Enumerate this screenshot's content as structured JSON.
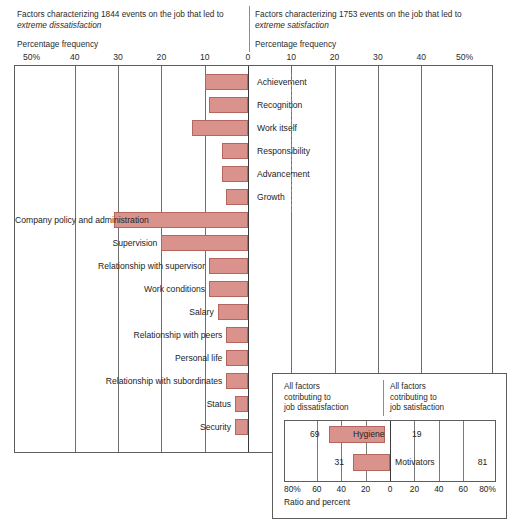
{
  "header": {
    "left": {
      "line1": "Factors characterizing 1844 events on the job that led to",
      "emphasis": "extreme dissatisfaction",
      "frequency_label": "Percentage frequency"
    },
    "right": {
      "line1": "Factors characterizing 1753 events on the job that led to",
      "emphasis": "extreme satisfaction",
      "frequency_label": "Percentage frequency"
    }
  },
  "axis": {
    "ticks": [
      "50%",
      "40",
      "30",
      "20",
      "10",
      "0",
      "10",
      "20",
      "30",
      "40",
      "50%"
    ],
    "tick_values": [
      -50,
      -40,
      -30,
      -20,
      -10,
      0,
      10,
      20,
      30,
      40,
      50
    ]
  },
  "inset": {
    "caption_left": "All factors cotributing to job dissatisfaction",
    "caption_left_lines": [
      "All factors",
      "cotributing to",
      "job dissatisfaction"
    ],
    "caption_right_lines": [
      "All factors",
      "cotributing to",
      "job satisfaction"
    ],
    "axis_title": "Ratio and percent",
    "ticks": [
      "80%",
      "60",
      "40",
      "20",
      "0",
      "20",
      "40",
      "60",
      "80%"
    ],
    "tick_values": [
      -80,
      -60,
      -40,
      -20,
      0,
      20,
      40,
      60,
      80
    ],
    "rows": [
      {
        "name": "Hygiene",
        "left_value": 69,
        "right_value": 19,
        "left_label": "69",
        "right_label": "19"
      },
      {
        "name": "Motivators",
        "left_value": 31,
        "right_value": 81,
        "left_label": "31",
        "right_label": "81"
      }
    ]
  },
  "colors": {
    "bar_fill": "#d9938c",
    "bar_stroke": "#b4655e",
    "frame": "#5d5d5d",
    "grid": "#6e6e6e",
    "text": "#232323"
  },
  "chart_data": {
    "type": "bar",
    "orientation": "horizontal-diverging",
    "xlabel": "Percentage frequency",
    "ylabel": "",
    "xlim": [
      -50,
      50
    ],
    "grid": true,
    "legend": "none",
    "note": "All bars extend to the left of zero (dissatisfaction side); the right half of the plot carries the labels for the motivator factors.",
    "categories": [
      "Achievement",
      "Recognition",
      "Work itself",
      "Responsibility",
      "Advancement",
      "Growth",
      "Company policy and administration",
      "Supervision",
      "Relationship with supervisor",
      "Work conditions",
      "Salary",
      "Relationship with peers",
      "Personal life",
      "Relationship with subordinates",
      "Status",
      "Security"
    ],
    "values": [
      -10,
      -9,
      -13,
      -6,
      -6,
      -5,
      -31,
      -20,
      -9,
      -9,
      -7,
      -5,
      -5,
      -5,
      -3,
      -3
    ],
    "label_side": [
      "right",
      "right",
      "right",
      "right",
      "right",
      "right",
      "left",
      "left",
      "left",
      "left",
      "left",
      "left",
      "left",
      "left",
      "left",
      "left"
    ],
    "group": [
      "motivator",
      "motivator",
      "motivator",
      "motivator",
      "motivator",
      "motivator",
      "hygiene",
      "hygiene",
      "hygiene",
      "hygiene",
      "hygiene",
      "hygiene",
      "hygiene",
      "hygiene",
      "hygiene",
      "hygiene"
    ]
  }
}
